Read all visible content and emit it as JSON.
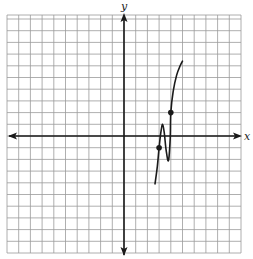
{
  "chart_data": {
    "type": "line",
    "title": "",
    "xlabel": "x",
    "ylabel": "y",
    "xlim": [
      -10,
      10
    ],
    "ylim": [
      -10,
      10
    ],
    "grid": true,
    "grid_step": 1,
    "tick_labels": false,
    "series": [
      {
        "name": "f(x)",
        "style": "smooth curve",
        "x": [
          2.65,
          2.85,
          3.0,
          3.15,
          3.3,
          3.45,
          3.6,
          3.8,
          3.95,
          4.0,
          4.2,
          4.5,
          4.8,
          5.0
        ],
        "y": [
          -4.1,
          -2.6,
          -1.0,
          0.3,
          1.0,
          0.2,
          -1.2,
          -2.1,
          -0.2,
          2.0,
          3.8,
          5.2,
          6.0,
          6.4
        ]
      }
    ],
    "marked_points": [
      {
        "x": 3,
        "y": -1
      },
      {
        "x": 4,
        "y": 2
      }
    ],
    "colors": {
      "grid": "#9a9a9a",
      "axis": "#1a1a1a",
      "curve": "#1a1a1a"
    }
  },
  "labels": {
    "x_axis": "x",
    "y_axis": "y"
  }
}
